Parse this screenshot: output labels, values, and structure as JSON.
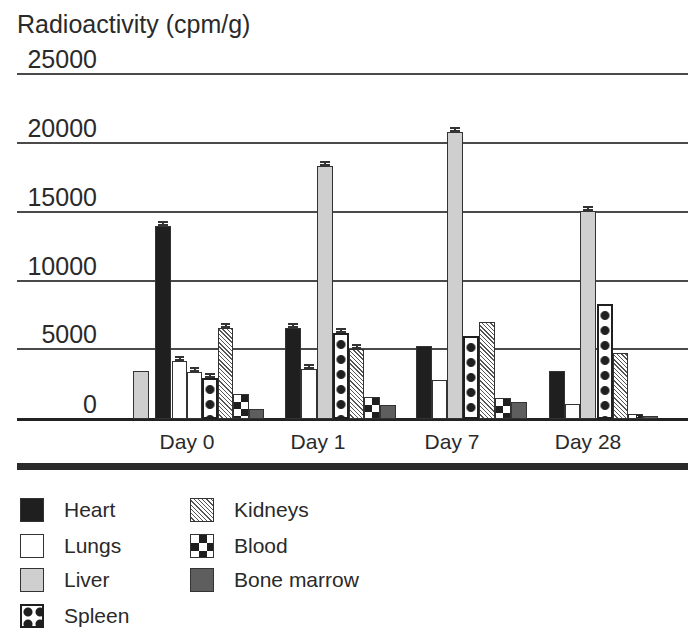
{
  "chart_data": {
    "type": "bar",
    "title": "",
    "ylabel": "Radioactivity (cpm/g)",
    "xlabel": "",
    "ylim": [
      0,
      25000
    ],
    "yticks": [
      0,
      5000,
      10000,
      15000,
      20000,
      25000
    ],
    "grid": true,
    "legend_position": "bottom",
    "categories": [
      "Day 0",
      "Day 1",
      "Day 7",
      "Day 28"
    ],
    "series": [
      {
        "name": "Heart",
        "values": [
          14000,
          6600,
          5300,
          3500
        ]
      },
      {
        "name": "Lungs",
        "values": [
          4200,
          3600,
          2800,
          1100
        ]
      },
      {
        "name": "Liver",
        "values": [
          3500,
          18300,
          20800,
          15100
        ]
      },
      {
        "name": "Spleen",
        "values": [
          3000,
          6200,
          6000,
          8300
        ]
      },
      {
        "name": "Kidneys",
        "values": [
          6600,
          5100,
          7000,
          4800
        ]
      },
      {
        "name": "Blood",
        "values": [
          1800,
          1600,
          1500,
          350
        ]
      },
      {
        "name": "Bone marrow",
        "values": [
          700,
          1000,
          1200,
          200
        ]
      }
    ],
    "bars_as_drawn": [
      {
        "group": "Day 0",
        "bars": [
          {
            "series": "Liver",
            "value": 3500,
            "x": 133,
            "w": 16,
            "error": false
          },
          {
            "series": "Heart",
            "value": 14000,
            "x": 155,
            "w": 16,
            "error": true
          },
          {
            "series": "Lungs",
            "value": 4200,
            "x": 172,
            "w": 15,
            "error": true
          },
          {
            "series": "Lungs",
            "value": 3400,
            "x": 187,
            "w": 15,
            "error": true
          },
          {
            "series": "Spleen",
            "value": 3000,
            "x": 202,
            "w": 16,
            "error": true
          },
          {
            "series": "Kidneys",
            "value": 6600,
            "x": 218,
            "w": 15,
            "error": true
          },
          {
            "series": "Blood",
            "value": 1800,
            "x": 233,
            "w": 16,
            "error": false
          },
          {
            "series": "Bone marrow",
            "value": 700,
            "x": 249,
            "w": 15,
            "error": false
          }
        ]
      },
      {
        "group": "Day 1",
        "bars": [
          {
            "series": "Heart",
            "value": 6600,
            "x": 285,
            "w": 16,
            "error": true
          },
          {
            "series": "Lungs",
            "value": 3600,
            "x": 301,
            "w": 16,
            "error": true
          },
          {
            "series": "Liver",
            "value": 18300,
            "x": 317,
            "w": 16,
            "error": true
          },
          {
            "series": "Spleen",
            "value": 6200,
            "x": 333,
            "w": 16,
            "error": true
          },
          {
            "series": "Kidneys",
            "value": 5100,
            "x": 349,
            "w": 15,
            "error": true
          },
          {
            "series": "Blood",
            "value": 1600,
            "x": 364,
            "w": 16,
            "error": false
          },
          {
            "series": "Bone marrow",
            "value": 1000,
            "x": 380,
            "w": 16,
            "error": false
          }
        ]
      },
      {
        "group": "Day 7",
        "bars": [
          {
            "series": "Heart",
            "value": 5300,
            "x": 416,
            "w": 16,
            "error": false
          },
          {
            "series": "Lungs",
            "value": 2800,
            "x": 432,
            "w": 15,
            "error": false
          },
          {
            "series": "Liver",
            "value": 20800,
            "x": 447,
            "w": 16,
            "error": true
          },
          {
            "series": "Spleen",
            "value": 6000,
            "x": 463,
            "w": 16,
            "error": false
          },
          {
            "series": "Kidneys",
            "value": 7000,
            "x": 479,
            "w": 16,
            "error": false
          },
          {
            "series": "Blood",
            "value": 1500,
            "x": 495,
            "w": 16,
            "error": false
          },
          {
            "series": "Bone marrow",
            "value": 1200,
            "x": 511,
            "w": 16,
            "error": false
          }
        ]
      },
      {
        "group": "Day 28",
        "bars": [
          {
            "series": "Heart",
            "value": 3500,
            "x": 549,
            "w": 16,
            "error": false
          },
          {
            "series": "Lungs",
            "value": 1100,
            "x": 565,
            "w": 15,
            "error": false
          },
          {
            "series": "Liver",
            "value": 15100,
            "x": 580,
            "w": 16,
            "error": true
          },
          {
            "series": "Spleen",
            "value": 8300,
            "x": 597,
            "w": 16,
            "error": false
          },
          {
            "series": "Kidneys",
            "value": 4800,
            "x": 613,
            "w": 15,
            "error": false
          },
          {
            "series": "Blood",
            "value": 350,
            "x": 628,
            "w": 15,
            "error": false
          },
          {
            "series": "Bone marrow",
            "value": 200,
            "x": 643,
            "w": 15,
            "error": false
          }
        ]
      }
    ]
  },
  "axis": {
    "title": "Radioactivity (cpm/g)",
    "ticks": [
      {
        "label": "25000",
        "y": 74
      },
      {
        "label": "20000",
        "y": 143
      },
      {
        "label": "15000",
        "y": 212
      },
      {
        "label": "10000",
        "y": 281
      },
      {
        "label": "5000",
        "y": 349
      },
      {
        "label": "0",
        "y": 419
      }
    ]
  },
  "xaxis": {
    "labels": [
      {
        "label": "Day 0",
        "cx": 187
      },
      {
        "label": "Day 1",
        "cx": 318
      },
      {
        "label": "Day 7",
        "cx": 452
      },
      {
        "label": "Day 28",
        "cx": 588
      }
    ]
  },
  "legend": {
    "items": [
      {
        "label": "Heart",
        "pattern": "heart",
        "x": 20,
        "y": 497
      },
      {
        "label": "Lungs",
        "pattern": "lungs",
        "x": 20,
        "y": 533
      },
      {
        "label": "Liver",
        "pattern": "liver",
        "x": 20,
        "y": 567
      },
      {
        "label": "Spleen",
        "pattern": "spleen",
        "x": 20,
        "y": 603
      },
      {
        "label": "Kidneys",
        "pattern": "kidneys",
        "x": 190,
        "y": 497
      },
      {
        "label": "Blood",
        "pattern": "blood",
        "x": 190,
        "y": 533
      },
      {
        "label": "Bone marrow",
        "pattern": "marrow",
        "x": 190,
        "y": 567
      }
    ]
  }
}
